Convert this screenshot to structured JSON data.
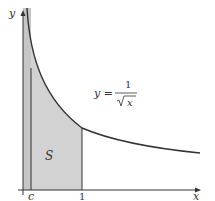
{
  "figure": {
    "axes": {
      "x_label": "x",
      "y_label": "y"
    },
    "ticks": {
      "c_label": "c",
      "one_label": "1"
    },
    "region_label": "S",
    "equation": {
      "lhs": "y =",
      "numerator": "1",
      "denominator": "x",
      "radical": "√"
    },
    "colors": {
      "curve": "#333333",
      "shade": "#d0d0d0",
      "shade_dark": "#c4c4c4",
      "axis": "#333333"
    },
    "function": "y = 1/sqrt(x)",
    "domain_shaded": [
      0,
      1
    ],
    "c_value": "c"
  }
}
